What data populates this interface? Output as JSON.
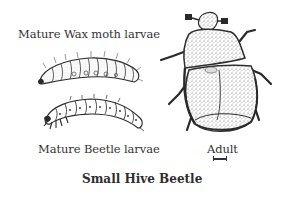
{
  "figure": {
    "title": "Small Hive Beetle",
    "labels": {
      "wax_moth_larvae": "Mature Wax moth larvae",
      "beetle_larvae": "Mature Beetle larvae",
      "adult": "Adult"
    },
    "illustrations": [
      {
        "name": "wax-moth-larva",
        "caption": "Mature Wax moth larvae"
      },
      {
        "name": "beetle-larva",
        "caption": "Mature Beetle larvae"
      },
      {
        "name": "adult-beetle",
        "caption": "Adult"
      }
    ],
    "scale_bar": "present under Adult label"
  },
  "colors": {
    "ink": "#2a2a2a",
    "background": "#ffffff",
    "stipple": "#b8b8b8"
  }
}
